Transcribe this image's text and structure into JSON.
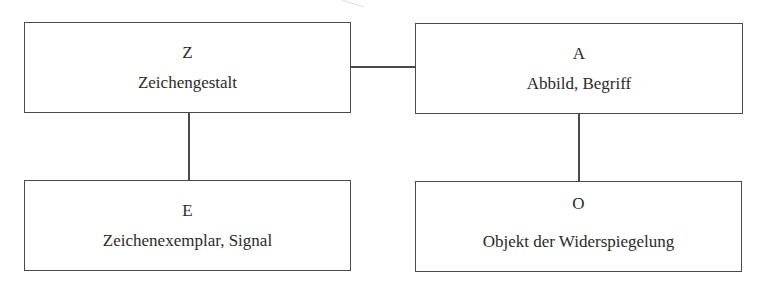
{
  "diagram": {
    "type": "semiotic-quadrilateral",
    "nodes": [
      {
        "id": "Z",
        "symbol": "Z",
        "label": "Zeichengestalt"
      },
      {
        "id": "A",
        "symbol": "A",
        "label": "Abbild, Begriff"
      },
      {
        "id": "E",
        "symbol": "E",
        "label": "Zeichenexemplar, Signal"
      },
      {
        "id": "O",
        "symbol": "O",
        "label": "Objekt der Widerspiegelung"
      }
    ],
    "edges": [
      {
        "from": "Z",
        "to": "A",
        "orientation": "horizontal"
      },
      {
        "from": "Z",
        "to": "E",
        "orientation": "vertical"
      },
      {
        "from": "A",
        "to": "O",
        "orientation": "vertical"
      }
    ]
  },
  "colors": {
    "stroke": "#4a4a4a",
    "text": "#2a2a2a",
    "background": "#ffffff"
  }
}
